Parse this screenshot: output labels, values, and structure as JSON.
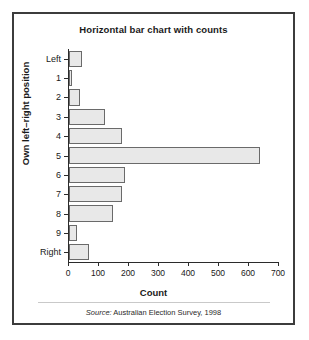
{
  "figure": {
    "title": "Horizontal bar chart with counts",
    "source_prefix": "Source:",
    "source_text": " Australian Election Survey, 1998",
    "frame_color": "#3c3c3c",
    "bar_fill": "#e8e8e8",
    "bar_edge": "#6a6a6a"
  },
  "chart_data": {
    "type": "bar",
    "orientation": "horizontal",
    "title": "Horizontal bar chart with counts",
    "xlabel": "Count",
    "ylabel": "Own left–right position",
    "categories": [
      "Left",
      "1",
      "2",
      "3",
      "4",
      "5",
      "6",
      "7",
      "8",
      "9",
      "Right"
    ],
    "values": [
      42,
      10,
      38,
      120,
      175,
      635,
      188,
      178,
      145,
      27,
      65
    ],
    "xlim": [
      0,
      700
    ],
    "xticks": [
      0,
      100,
      200,
      300,
      400,
      500,
      600,
      700
    ],
    "xticklabels": [
      "0",
      "100",
      "200",
      "300",
      "400",
      "500",
      "600",
      "700"
    ],
    "grid": false,
    "legend": null,
    "annotations": [
      "Source: Australian Election Survey, 1998"
    ]
  }
}
